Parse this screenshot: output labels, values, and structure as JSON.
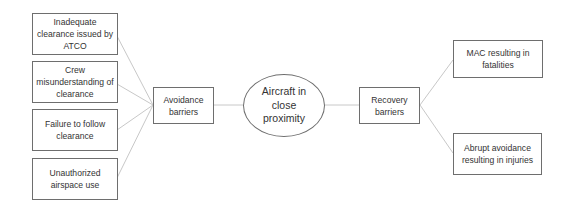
{
  "diagram": {
    "type": "bowtie",
    "causes": [
      {
        "id": "cause-1",
        "label": "Inadequate clearance issued by ATCO"
      },
      {
        "id": "cause-2",
        "label": "Crew misunderstanding of clearance"
      },
      {
        "id": "cause-3",
        "label": "Failure to follow clearance"
      },
      {
        "id": "cause-4",
        "label": "Unauthorized airspace use"
      }
    ],
    "avoidance_barriers": {
      "label": "Avoidance barriers"
    },
    "central_event": {
      "label": "Aircraft in close proximity"
    },
    "recovery_barriers": {
      "label": "Recovery barriers"
    },
    "consequences": [
      {
        "id": "consequence-1",
        "label": "MAC resulting in fatalities"
      },
      {
        "id": "consequence-2",
        "label": "Abrupt avoidance resulting in injuries"
      }
    ],
    "edges": [
      [
        "cause-1",
        "avoidance_barriers"
      ],
      [
        "cause-2",
        "avoidance_barriers"
      ],
      [
        "cause-3",
        "avoidance_barriers"
      ],
      [
        "cause-4",
        "avoidance_barriers"
      ],
      [
        "avoidance_barriers",
        "central_event"
      ],
      [
        "central_event",
        "recovery_barriers"
      ],
      [
        "recovery_barriers",
        "consequence-1"
      ],
      [
        "recovery_barriers",
        "consequence-2"
      ]
    ],
    "colors": {
      "border": "#6e6e6e",
      "connector": "#c8c8c8",
      "text": "#333333"
    }
  }
}
